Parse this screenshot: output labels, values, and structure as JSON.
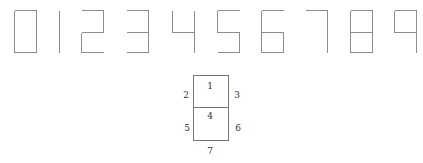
{
  "digits": [
    {
      "digit": "0",
      "segments": [
        1,
        2,
        3,
        5,
        6,
        7
      ]
    },
    {
      "digit": "1",
      "segments": [
        3,
        6
      ]
    },
    {
      "digit": "2",
      "segments": [
        1,
        3,
        4,
        5,
        7
      ]
    },
    {
      "digit": "3",
      "segments": [
        1,
        3,
        4,
        6,
        7
      ]
    },
    {
      "digit": "4",
      "segments": [
        2,
        3,
        4,
        6
      ]
    },
    {
      "digit": "5",
      "segments": [
        1,
        2,
        4,
        6,
        7
      ]
    },
    {
      "digit": "6",
      "segments": [
        1,
        2,
        4,
        5,
        6,
        7
      ]
    },
    {
      "digit": "7",
      "segments": [
        1,
        3,
        6
      ]
    },
    {
      "digit": "8",
      "segments": [
        1,
        2,
        3,
        4,
        5,
        6,
        7
      ]
    },
    {
      "digit": "9",
      "segments": [
        1,
        2,
        3,
        4,
        6
      ]
    }
  ],
  "segment_key": {
    "labels": [
      "1",
      "2",
      "3",
      "4",
      "5",
      "6",
      "7"
    ],
    "description": {
      "1": "top",
      "2": "upper-left",
      "3": "upper-right",
      "4": "middle",
      "5": "lower-left",
      "6": "lower-right",
      "7": "bottom"
    }
  },
  "colors": {
    "stroke": "#8c8c8c",
    "key_stroke": "#777777",
    "label": "#333333"
  }
}
